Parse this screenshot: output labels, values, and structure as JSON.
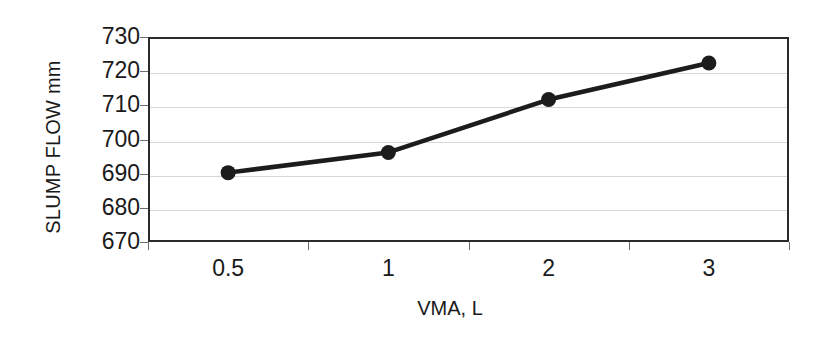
{
  "chart_data": {
    "type": "line",
    "title": "",
    "subtitle": "",
    "xlabel": "VMA, L",
    "ylabel": "SLUMP FLOW mm",
    "categories": [
      "0.5",
      "1",
      "2",
      "3"
    ],
    "values": [
      690.3,
      696.2,
      711.7,
      722.4
    ],
    "series": [
      {
        "name": "SLUMP FLOW",
        "values": [
          690.3,
          696.2,
          711.7,
          722.4
        ]
      }
    ],
    "ylim": [
      670,
      730
    ],
    "ytick_labels": [
      "730",
      "720",
      "710",
      "700",
      "690",
      "680",
      "670"
    ],
    "ytick_values": [
      730,
      720,
      710,
      700,
      690,
      680,
      670
    ],
    "ytick_step": 10,
    "xtick_labels": [
      "0.5",
      "1",
      "2",
      "3"
    ],
    "grid": true,
    "grid_axis": "y",
    "legend": false,
    "legend_position": "none",
    "marker": "circle",
    "marker_filled": true,
    "annotations": []
  },
  "style": {
    "line_color": "#1c1c1c",
    "marker_color": "#1c1c1c",
    "grid_color": "#d8d8d8",
    "frame_color": "#2b2b2b",
    "tick_color": "#6e6e6e",
    "background_color": "#ffffff",
    "text_color": "#1a1a1a"
  }
}
